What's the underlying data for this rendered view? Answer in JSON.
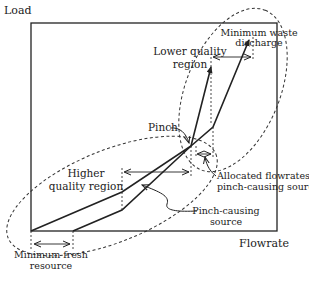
{
  "diagram": {
    "type": "material recovery pinch diagram",
    "axes": {
      "y_label": "Load",
      "x_label": "Flowrate"
    },
    "regions": {
      "lower": {
        "line1": "Lower quality",
        "line2": "region"
      },
      "higher": {
        "line1": "Higher",
        "line2": "quality region"
      }
    },
    "annotations": {
      "pinch": "Pinch",
      "min_waste": {
        "line1": "Minimum waste",
        "line2": "discharge"
      },
      "allocated": {
        "line1": "Allocated flowrates of",
        "line2": "pinch-causing source"
      },
      "pinch_source": {
        "line1": "Pinch-causing",
        "line2": "source"
      },
      "min_fresh": {
        "line1": "Minimum fresh",
        "line2": "resource"
      }
    },
    "colors": {
      "line": "#222222",
      "background": "#ffffff"
    }
  }
}
